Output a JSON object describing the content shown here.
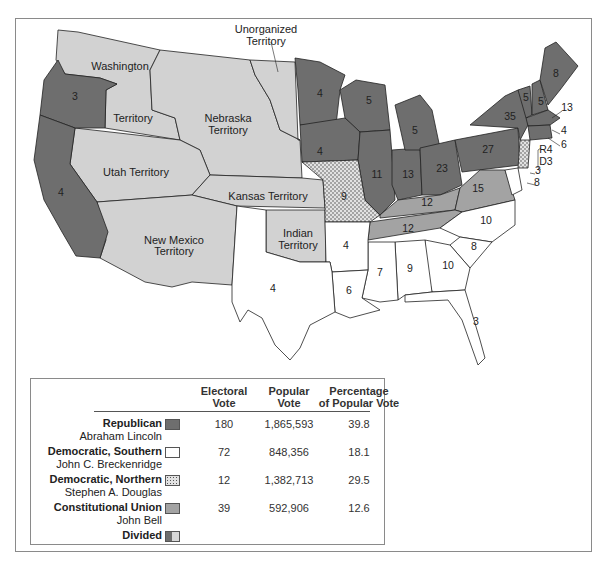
{
  "map": {
    "territory_labels": [
      {
        "name": "Unorganized\nTerritory",
        "x": 266,
        "y": 33
      },
      {
        "name": "Washington",
        "x": 120,
        "y": 68
      },
      {
        "name": "Territory",
        "x": 133,
        "y": 120
      },
      {
        "name": "Nebraska",
        "x": 228,
        "y": 120
      },
      {
        "name": "Territory",
        "x": 228,
        "y": 132
      },
      {
        "name": "Utah Territory",
        "x": 136,
        "y": 173
      },
      {
        "name": "Kansas Territory",
        "x": 268,
        "y": 198
      },
      {
        "name": "New Mexico",
        "x": 174,
        "y": 242
      },
      {
        "name": "Territory",
        "x": 174,
        "y": 253
      },
      {
        "name": "Indian",
        "x": 298,
        "y": 236
      },
      {
        "name": "Territory",
        "x": 298,
        "y": 248
      }
    ],
    "electoral_labels": [
      {
        "v": "3",
        "x": 75,
        "y": 100
      },
      {
        "v": "4",
        "x": 61,
        "y": 196
      },
      {
        "v": "4",
        "x": 320,
        "y": 97
      },
      {
        "v": "5",
        "x": 369,
        "y": 104
      },
      {
        "v": "5",
        "x": 415,
        "y": 134
      },
      {
        "v": "4",
        "x": 320,
        "y": 155
      },
      {
        "v": "11",
        "x": 377,
        "y": 178
      },
      {
        "v": "13",
        "x": 408,
        "y": 178
      },
      {
        "v": "23",
        "x": 442,
        "y": 172
      },
      {
        "v": "27",
        "x": 488,
        "y": 153
      },
      {
        "v": "35",
        "x": 510,
        "y": 120
      },
      {
        "v": "8",
        "x": 556,
        "y": 77
      },
      {
        "v": "5",
        "x": 526,
        "y": 101
      },
      {
        "v": "5",
        "x": 541,
        "y": 105
      },
      {
        "v": "13",
        "x": 567,
        "y": 111
      },
      {
        "v": "4",
        "x": 564,
        "y": 134
      },
      {
        "v": "6",
        "x": 564,
        "y": 148
      },
      {
        "v": "R4",
        "x": 546,
        "y": 153
      },
      {
        "v": "D3",
        "x": 546,
        "y": 165
      },
      {
        "v": "3",
        "x": 538,
        "y": 174
      },
      {
        "v": "8",
        "x": 537,
        "y": 186
      },
      {
        "v": "9",
        "x": 344,
        "y": 200
      },
      {
        "v": "12",
        "x": 427,
        "y": 206
      },
      {
        "v": "15",
        "x": 478,
        "y": 192
      },
      {
        "v": "12",
        "x": 408,
        "y": 232
      },
      {
        "v": "10",
        "x": 486,
        "y": 224
      },
      {
        "v": "4",
        "x": 346,
        "y": 249
      },
      {
        "v": "8",
        "x": 474,
        "y": 250
      },
      {
        "v": "7",
        "x": 380,
        "y": 276
      },
      {
        "v": "9",
        "x": 410,
        "y": 272
      },
      {
        "v": "10",
        "x": 448,
        "y": 269
      },
      {
        "v": "6",
        "x": 349,
        "y": 294
      },
      {
        "v": "4",
        "x": 273,
        "y": 292
      },
      {
        "v": "3",
        "x": 476,
        "y": 325
      }
    ],
    "colors": {
      "republican": "#6e6e6e",
      "southern_democrat": "#ffffff",
      "northern_democrat": "#d8d8d8",
      "constitutional_union": "#a3a3a3",
      "territory": "#d0d0d0",
      "border": "#222222"
    }
  },
  "legend": {
    "headers": {
      "electoral": [
        "Electoral",
        "Vote"
      ],
      "popular": [
        "Popular",
        "Vote"
      ],
      "percentage": [
        "Percentage",
        "of Popular Vote"
      ]
    },
    "rows": [
      {
        "party": "Republican",
        "candidate": "Abraham Lincoln",
        "electoral": "180",
        "popular": "1,865,593",
        "percent": "39.8",
        "swatch": "solid-dark"
      },
      {
        "party": "Democratic, Southern",
        "candidate": "John C. Breckenridge",
        "electoral": "72",
        "popular": "848,356",
        "percent": "18.1",
        "swatch": "white"
      },
      {
        "party": "Democratic, Northern",
        "candidate": "Stephen A. Douglas",
        "electoral": "12",
        "popular": "1,382,713",
        "percent": "29.5",
        "swatch": "dotted"
      },
      {
        "party": "Constitutional Union",
        "candidate": "John Bell",
        "electoral": "39",
        "popular": "592,906",
        "percent": "12.6",
        "swatch": "solid-medium"
      },
      {
        "party": "Divided",
        "candidate": "",
        "electoral": "",
        "popular": "",
        "percent": "",
        "swatch": "divided"
      }
    ]
  },
  "chart_data": {
    "type": "table",
    "columns": [
      "Party",
      "Candidate",
      "Electoral Vote",
      "Popular Vote",
      "Percentage of Popular Vote"
    ],
    "rows": [
      [
        "Republican",
        "Abraham Lincoln",
        180,
        1865593,
        39.8
      ],
      [
        "Democratic, Southern",
        "John C. Breckenridge",
        72,
        848356,
        18.1
      ],
      [
        "Democratic, Northern",
        "Stephen A. Douglas",
        12,
        1382713,
        29.5
      ],
      [
        "Constitutional Union",
        "John Bell",
        39,
        592906,
        12.6
      ],
      [
        "Divided",
        "",
        null,
        null,
        null
      ]
    ]
  }
}
